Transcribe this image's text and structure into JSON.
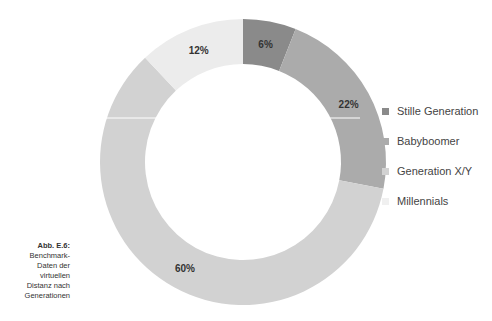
{
  "chart_data": {
    "type": "pie",
    "subtype": "donut",
    "title": "",
    "categories": [
      "Stille Generation",
      "Babyboomer",
      "Generation X/Y",
      "Millennials"
    ],
    "values": [
      6,
      22,
      60,
      12
    ],
    "labels": [
      "6%",
      "22%",
      "60%",
      "12%"
    ],
    "colors": [
      "#8a8a8a",
      "#ababab",
      "#d2d2d2",
      "#ececec"
    ],
    "legend_position": "right",
    "caption": "Abb. E.6: Benchmark-Daten der virtuellen Distanz nach Generationen"
  },
  "legend": {
    "items": [
      {
        "label": "Stille Generation",
        "color": "#8a8a8a"
      },
      {
        "label": "Babyboomer",
        "color": "#ababab"
      },
      {
        "label": "Generation X/Y",
        "color": "#d2d2d2"
      },
      {
        "label": "Millennials",
        "color": "#f0f0f0"
      }
    ]
  },
  "caption": {
    "title": "Abb. E.6:",
    "lines": [
      "Benchmark-",
      "Daten der",
      "virtuellen",
      "Distanz nach",
      "Generationen"
    ]
  }
}
